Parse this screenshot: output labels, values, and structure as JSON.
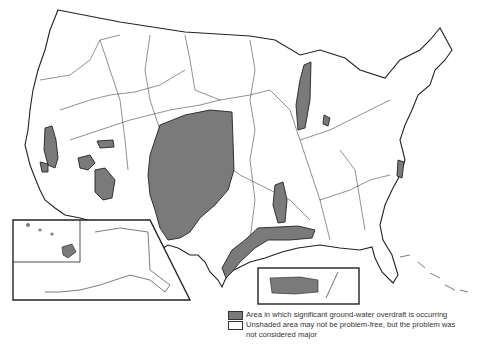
{
  "map": {
    "subject": "Ground-water overdraft areas, United States",
    "insets": [
      "Alaska and Hawaii",
      "Puerto Rico"
    ],
    "colors": {
      "shaded": "#7a7a7a",
      "outline": "#222222",
      "rivers": "#555555",
      "background": "#ffffff"
    }
  },
  "legend": {
    "items": [
      {
        "type": "shaded",
        "label": "Area in which significant ground-water overdraft is occurring"
      },
      {
        "type": "unshaded",
        "label": "Unshaded area may not be problem-free, but the problem was\nnot considered major"
      }
    ]
  }
}
